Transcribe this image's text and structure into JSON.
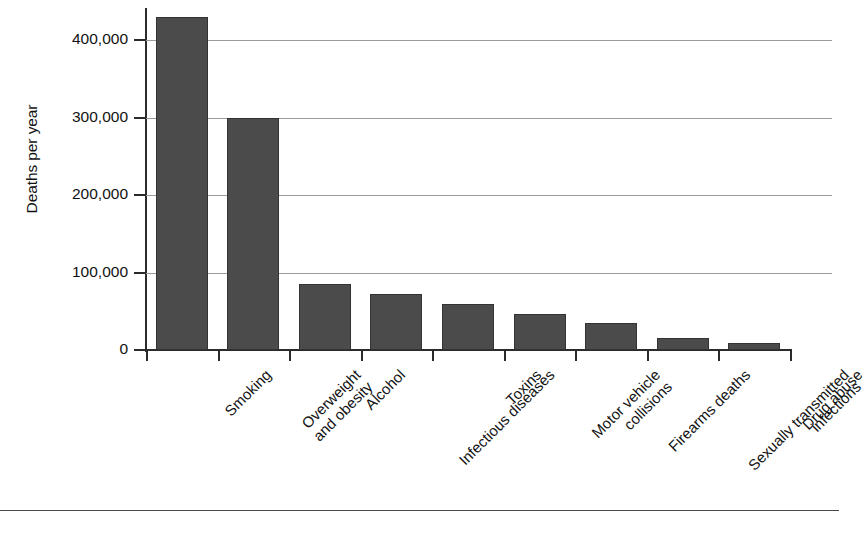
{
  "chart_data": {
    "type": "bar",
    "title": "",
    "xlabel": "",
    "ylabel": "Deaths per year",
    "ylim": [
      0,
      450000
    ],
    "grid": true,
    "legend": "none",
    "orientation": "vertical",
    "tick_label_rotation": -45,
    "categories": [
      "Smoking",
      "Overweight and obesity",
      "Alcohol",
      "Infectious diseases",
      "Toxins",
      "Motor vehicle collisions",
      "Firearms deaths",
      "Sexually transmitted infections",
      "Drug abuse"
    ],
    "category_lines": [
      [
        "Smoking"
      ],
      [
        "Overweight",
        "and obesity"
      ],
      [
        "Alcohol"
      ],
      [
        "Infectious diseases"
      ],
      [
        "Toxins"
      ],
      [
        "Motor vehicle",
        "collisions"
      ],
      [
        "Firearms deaths"
      ],
      [
        "Sexually transmitted",
        "infections"
      ],
      [
        "Drug abuse"
      ]
    ],
    "values": [
      430000,
      300000,
      85000,
      72000,
      59000,
      47000,
      35000,
      15000,
      9000
    ],
    "ytick_values": [
      0,
      100000,
      200000,
      300000,
      400000
    ],
    "ytick_labels": [
      "0",
      "100,000",
      "200,000",
      "300,000",
      "400,000"
    ],
    "bar_color": "#4b4b4b",
    "bar_edge_color": "#333333",
    "grid_color": "#9b9b9b",
    "axis_color": "#2b2b2b",
    "background_color": "#ffffff"
  }
}
